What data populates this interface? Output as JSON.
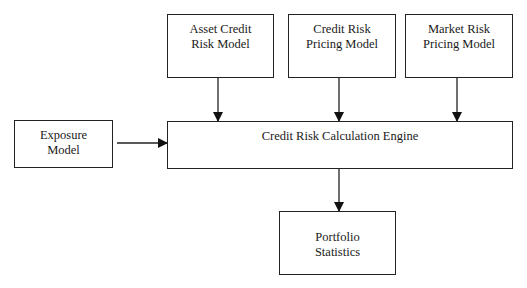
{
  "diagram": {
    "type": "flowchart",
    "nodes": {
      "asset_credit_risk_model": {
        "line1": "Asset Credit",
        "line2": "Risk Model"
      },
      "credit_risk_pricing_model": {
        "line1": "Credit Risk",
        "line2": "Pricing Model"
      },
      "market_risk_pricing_model": {
        "line1": "Market Risk",
        "line2": "Pricing Model"
      },
      "exposure_model": {
        "line1": "Exposure",
        "line2": "Model"
      },
      "calculation_engine": {
        "label": "Credit Risk Calculation Engine"
      },
      "portfolio_statistics": {
        "line1": "Portfolio",
        "line2": "Statistics"
      }
    },
    "edges": [
      {
        "from": "Asset Credit Risk Model",
        "to": "Credit Risk Calculation Engine"
      },
      {
        "from": "Credit Risk Pricing Model",
        "to": "Credit Risk Calculation Engine"
      },
      {
        "from": "Market Risk Pricing Model",
        "to": "Credit Risk Calculation Engine"
      },
      {
        "from": "Exposure Model",
        "to": "Credit Risk Calculation Engine"
      },
      {
        "from": "Credit Risk Calculation Engine",
        "to": "Portfolio Statistics"
      }
    ],
    "colors": {
      "stroke": "#222222",
      "background": "#ffffff"
    }
  }
}
